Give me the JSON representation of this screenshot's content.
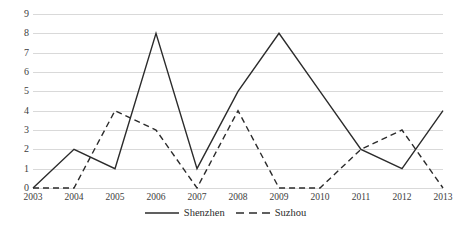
{
  "chart_data": {
    "type": "line",
    "title": "",
    "xlabel": "",
    "ylabel": "",
    "categories": [
      "2003",
      "2004",
      "2005",
      "2006",
      "2007",
      "2008",
      "2009",
      "2010",
      "2011",
      "2012",
      "2013"
    ],
    "series": [
      {
        "name": "Shenzhen",
        "style": "solid",
        "color": "#2b2b2b",
        "values": [
          0,
          2,
          1,
          8,
          1,
          5,
          8,
          5,
          2,
          1,
          4
        ]
      },
      {
        "name": "Suzhou",
        "style": "dashed",
        "color": "#2b2b2b",
        "values": [
          0,
          0,
          4,
          3,
          0,
          4,
          0,
          0,
          2,
          3,
          0
        ]
      }
    ],
    "ylim": [
      0,
      9
    ],
    "yticks": [
      "0",
      "1",
      "2",
      "3",
      "4",
      "5",
      "6",
      "7",
      "8",
      "9"
    ],
    "grid": true,
    "legend_position": "bottom-center"
  },
  "legend": {
    "items": [
      {
        "label": "Shenzhen",
        "style": "solid"
      },
      {
        "label": "Suzhou",
        "style": "dashed"
      }
    ]
  }
}
